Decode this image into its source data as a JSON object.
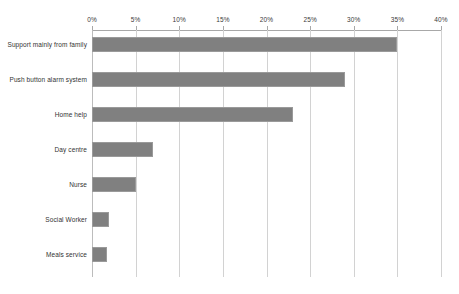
{
  "chart_data": {
    "type": "bar",
    "orientation": "horizontal",
    "title": "",
    "subtitle": "",
    "xlabel": "",
    "ylabel": "",
    "xlim": [
      0,
      40
    ],
    "xunit": "%",
    "grid": true,
    "legend": false,
    "legend_position": "none",
    "bar_color": "#808080",
    "gridline_color": "#d2d2d2",
    "background_color": "#ffffff",
    "xtick_labels": [
      "0%",
      "5%",
      "10%",
      "15%",
      "20%",
      "25%",
      "30%",
      "35%",
      "40%"
    ],
    "xticks": [
      0,
      5,
      10,
      15,
      20,
      25,
      30,
      35,
      40
    ],
    "categories": [
      "Support mainly from family",
      "Push button alarm system",
      "Home help",
      "Day centre",
      "Nurse",
      "Social Worker",
      "Meals service"
    ],
    "values": [
      35,
      29,
      23,
      7,
      5,
      2,
      1.7
    ],
    "series": [
      {
        "name": "",
        "values": [
          35,
          29,
          23,
          7,
          5,
          2,
          1.7
        ]
      }
    ]
  }
}
